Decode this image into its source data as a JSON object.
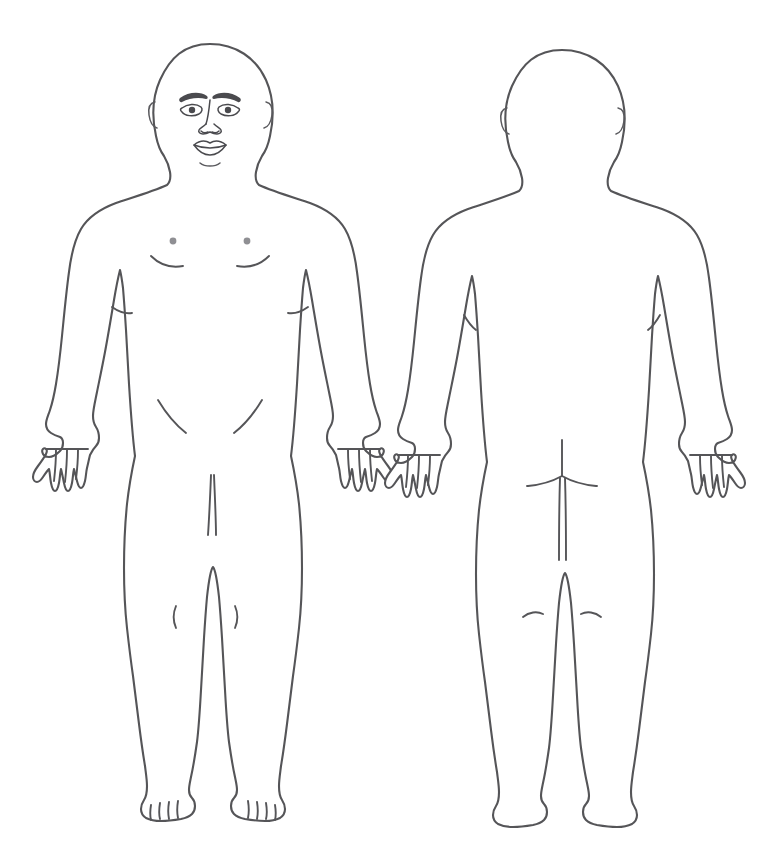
{
  "chart": {
    "background_color": "#ffffff",
    "line_color": "#555558",
    "feature_color": "#4a4a4e",
    "nipple_color": "#8f8f93",
    "width": 778,
    "height": 865,
    "style": "line-drawing outline, no fill, no labels",
    "figure_count": 2
  },
  "figures": [
    {
      "id": "anterior",
      "view": "front",
      "label": "Anterior view",
      "center_x": 210,
      "features": [
        "head-outline",
        "ears",
        "eyebrows",
        "eyes",
        "nose",
        "lips",
        "neck",
        "clavicle-shoulders",
        "nipples",
        "pectoral-creases",
        "elbow-creases",
        "inguinal-creases",
        "genital-midline",
        "patella-creases",
        "hands-with-fingers",
        "feet-with-toes"
      ]
    },
    {
      "id": "posterior",
      "view": "back",
      "label": "Posterior view",
      "center_x": 562,
      "features": [
        "head-outline-back",
        "ears",
        "neck",
        "shoulders",
        "axillary-creases",
        "gluteal-cleft",
        "gluteal-folds",
        "popliteal-creases",
        "hands-with-fingers",
        "heels"
      ]
    }
  ],
  "annotations": {
    "markers": [],
    "legend": [],
    "caption": ""
  }
}
